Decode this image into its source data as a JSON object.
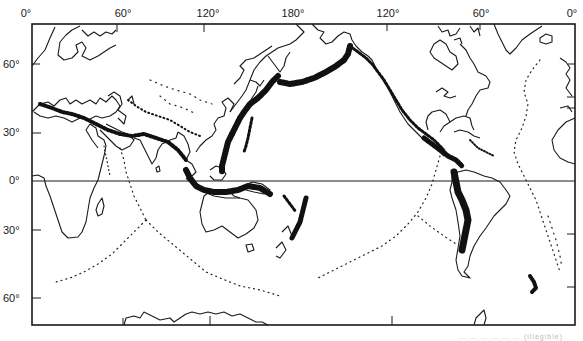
{
  "map": {
    "title": "World seismicity map (Pacific-centered)",
    "projection": "Cylindrical, Pacific-centered (0° at both edges, 180° center)",
    "frame": {
      "left": 32,
      "top": 24,
      "right": 575,
      "bottom": 325,
      "stroke": "#1a1a1a"
    },
    "equator_y": 181,
    "longitude_labels": [
      {
        "text": "0°",
        "x": 26
      },
      {
        "text": "60°",
        "x": 123
      },
      {
        "text": "120°",
        "x": 208
      },
      {
        "text": "180°",
        "x": 293
      },
      {
        "text": "120°",
        "x": 388
      },
      {
        "text": "60°",
        "x": 481
      },
      {
        "text": "0°",
        "x": 572
      }
    ],
    "longitude_ticks_x": [
      117,
      204,
      294,
      387,
      480
    ],
    "latitude_labels": [
      {
        "text": "60°",
        "y": 64
      },
      {
        "text": "30°",
        "y": 132
      },
      {
        "text": "0°",
        "y": 180
      },
      {
        "text": "30°",
        "y": 230
      },
      {
        "text": "60°",
        "y": 298
      }
    ],
    "latitude_ticks_y": [
      64,
      133,
      230,
      298
    ],
    "features": [
      "Pacific Ring of Fire (dense earthquake epicenters)",
      "Alpide belt (Mediterranean–Himalaya)",
      "Mid-Atlantic Ridge (sparse epicenters)",
      "Mid-Indian Ocean ridges",
      "East Pacific Rise",
      "Tonga–Kermadec trench",
      "Andes subduction zone",
      "Scotia arc"
    ],
    "legend": "Dots represent earthquake epicenters",
    "colors": {
      "ink": "#111111",
      "background": "#ffffff",
      "coast": "#1a1a1a"
    },
    "caption": "… … … … … … (illegible)"
  }
}
